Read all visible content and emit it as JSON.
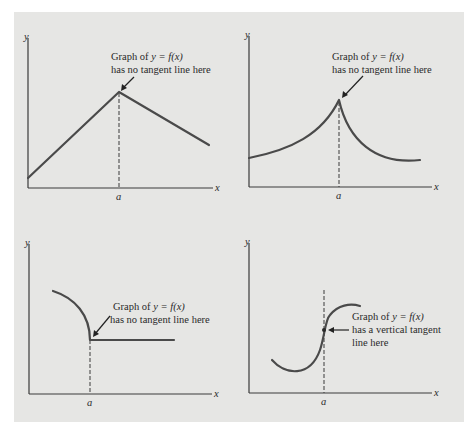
{
  "figure": {
    "background_color": "#e6e6e4",
    "curve_color": "#4a4a4a",
    "panels": [
      {
        "id": "top-left",
        "axis_y_label": "y",
        "axis_x_label": "x",
        "tick_label": "a",
        "annotation_line1_prefix": "Graph of ",
        "annotation_line1_math": "y = f(x)",
        "annotation_line2": "has no tangent line here",
        "description": "Piecewise linear function with a corner at x = a"
      },
      {
        "id": "top-right",
        "axis_y_label": "y",
        "axis_x_label": "x",
        "tick_label": "a",
        "annotation_line1_prefix": "Graph of ",
        "annotation_line1_math": "y = f(x)",
        "annotation_line2": "has no tangent line here",
        "description": "Curve with a cusp at x = a"
      },
      {
        "id": "bottom-left",
        "axis_y_label": "y",
        "axis_x_label": "x",
        "tick_label": "a",
        "annotation_line1_prefix": "Graph of ",
        "annotation_line1_math": "y = f(x)",
        "annotation_line2": "has no tangent line here",
        "description": "Quarter-circle arc meeting a horizontal line at x = a"
      },
      {
        "id": "bottom-right",
        "axis_y_label": "y",
        "axis_x_label": "x",
        "tick_label": "a",
        "annotation_line1_prefix": "Graph of ",
        "annotation_line1_math": "y = f(x)",
        "annotation_line2": "has a vertical tangent",
        "annotation_line3": "line here",
        "description": "S-shaped curve with a vertical inflection tangent at x = a"
      }
    ]
  }
}
